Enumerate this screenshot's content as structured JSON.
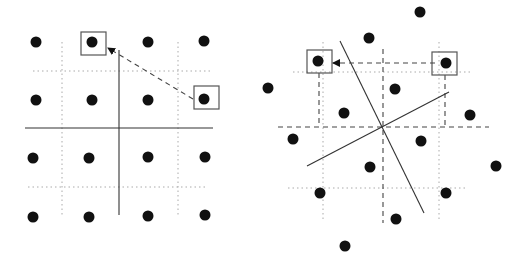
{
  "figure": {
    "colors": {
      "dot": "#111111",
      "line": "#333333",
      "grid": "#aaaaaa",
      "box": "#555555"
    }
  },
  "left_panel": {
    "dots": [
      [
        36,
        42
      ],
      [
        92,
        42
      ],
      [
        148,
        42
      ],
      [
        204,
        41
      ],
      [
        36,
        100
      ],
      [
        92,
        100
      ],
      [
        148,
        100
      ],
      [
        204,
        99
      ],
      [
        33,
        158
      ],
      [
        89,
        158
      ],
      [
        148,
        157
      ],
      [
        205,
        157
      ],
      [
        33,
        217
      ],
      [
        89,
        217
      ],
      [
        148,
        216
      ],
      [
        205,
        215
      ]
    ],
    "boxes": [
      [
        81,
        32,
        25,
        23
      ],
      [
        194,
        86,
        25,
        23
      ]
    ],
    "solid_lines": [
      [
        119,
        50,
        119,
        215
      ],
      [
        25,
        128,
        213,
        128
      ]
    ],
    "dotted_lines": [
      [
        62,
        42,
        62,
        217
      ],
      [
        178,
        42,
        178,
        215
      ],
      [
        33,
        71,
        213,
        71
      ],
      [
        28,
        187,
        208,
        187
      ]
    ],
    "arrow": [
      193,
      99,
      108,
      48
    ]
  },
  "right_panel": {
    "dots": [
      [
        420,
        12
      ],
      [
        369,
        38
      ],
      [
        318,
        61
      ],
      [
        446,
        63
      ],
      [
        268,
        88
      ],
      [
        395,
        89
      ],
      [
        344,
        113
      ],
      [
        470,
        115
      ],
      [
        293,
        139
      ],
      [
        421,
        141
      ],
      [
        370,
        167
      ],
      [
        496,
        166
      ],
      [
        320,
        193
      ],
      [
        446,
        193
      ],
      [
        396,
        219
      ],
      [
        345,
        246
      ]
    ],
    "boxes": [
      [
        307,
        50,
        25,
        23
      ],
      [
        432,
        52,
        25,
        23
      ]
    ],
    "solid_lines": [
      [
        340,
        41,
        424,
        213
      ],
      [
        307,
        166,
        449,
        92
      ]
    ],
    "dotted_lines": [
      [
        323,
        42,
        323,
        219
      ],
      [
        439,
        42,
        439,
        219
      ],
      [
        293,
        72,
        473,
        72
      ],
      [
        288,
        188,
        468,
        188
      ]
    ],
    "dashed_lines": [
      [
        383,
        49,
        383,
        223
      ],
      [
        278,
        127,
        489,
        127
      ],
      [
        319,
        73,
        319,
        127
      ],
      [
        445,
        75,
        445,
        127
      ]
    ],
    "arrow": [
      435,
      63,
      333,
      63
    ]
  }
}
